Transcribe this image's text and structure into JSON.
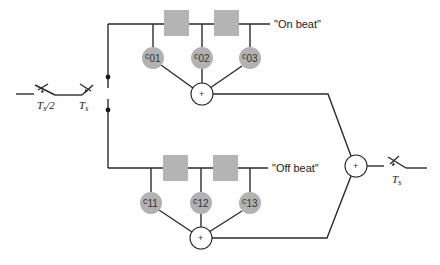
{
  "diagram": {
    "type": "filter-bank signal flow",
    "input_switches": [
      {
        "label_main": "T",
        "label_sub": "s",
        "label_suffix": "/2"
      },
      {
        "label_main": "T",
        "label_sub": "s",
        "label_suffix": ""
      }
    ],
    "branches": [
      {
        "name": "On beat",
        "label": "\"On beat\"",
        "coefficients": [
          {
            "main": "c",
            "sub": "01"
          },
          {
            "main": "c",
            "sub": "02"
          },
          {
            "main": "c",
            "sub": "03"
          }
        ],
        "delay_count": 2,
        "summer_symbol": "+"
      },
      {
        "name": "Off beat",
        "label": "\"Off beat\"",
        "coefficients": [
          {
            "main": "c",
            "sub": "11"
          },
          {
            "main": "c",
            "sub": "12"
          },
          {
            "main": "c",
            "sub": "13"
          }
        ],
        "delay_count": 2,
        "summer_symbol": "+"
      }
    ],
    "output_summer_symbol": "+",
    "output_switch": {
      "label_main": "T",
      "label_sub": "s"
    },
    "colors": {
      "wire": "#2b2b2b",
      "block_fill": "#b4b4b4",
      "coef_fill": "#b2b2b2",
      "background": "#ffffff"
    }
  }
}
